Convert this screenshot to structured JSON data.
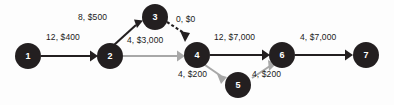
{
  "diagram": {
    "colors": {
      "node_fill": "#231f20",
      "node_text": "#ffffff",
      "edge_dark": "#231f20",
      "edge_gray": "#a8a8a8",
      "background": "#fdfdfd"
    },
    "nodes": [
      {
        "id": "1",
        "label": "1",
        "cx": 28,
        "cy": 56,
        "r": 13
      },
      {
        "id": "2",
        "label": "2",
        "cx": 110,
        "cy": 56,
        "r": 13
      },
      {
        "id": "3",
        "label": "3",
        "cx": 155,
        "cy": 17,
        "r": 13
      },
      {
        "id": "4",
        "label": "4",
        "cx": 197,
        "cy": 55,
        "r": 13
      },
      {
        "id": "5",
        "label": "5",
        "cx": 238,
        "cy": 85,
        "r": 13
      },
      {
        "id": "6",
        "label": "6",
        "cx": 282,
        "cy": 55,
        "r": 13
      },
      {
        "id": "7",
        "label": "7",
        "cx": 366,
        "cy": 55,
        "r": 13
      }
    ],
    "edges": [
      {
        "id": "e1",
        "from": "1",
        "to": "2",
        "label": "12, $400",
        "capacity": 12,
        "cost": "$400",
        "style": "dark"
      },
      {
        "id": "e2",
        "from": "2",
        "to": "3",
        "label": "8, $500",
        "capacity": 8,
        "cost": "$500",
        "style": "dark"
      },
      {
        "id": "e3",
        "from": "2",
        "to": "4",
        "label": "4, $3,000",
        "capacity": 4,
        "cost": "$3,000",
        "style": "gray"
      },
      {
        "id": "e4",
        "from": "3",
        "to": "4",
        "label": "0, $0",
        "capacity": 0,
        "cost": "$0",
        "style": "dashed"
      },
      {
        "id": "e5",
        "from": "4",
        "to": "6",
        "label": "12, $7,000",
        "capacity": 12,
        "cost": "$7,000",
        "style": "dark"
      },
      {
        "id": "e6",
        "from": "4",
        "to": "5",
        "label": "4, $200",
        "capacity": 4,
        "cost": "$200",
        "style": "gray"
      },
      {
        "id": "e7",
        "from": "5",
        "to": "6",
        "label": "4, $200",
        "capacity": 4,
        "cost": "$200",
        "style": "gray"
      },
      {
        "id": "e8",
        "from": "6",
        "to": "7",
        "label": "4, $7,000",
        "capacity": 4,
        "cost": "$7,000",
        "style": "dark"
      }
    ],
    "edge_labels": [
      {
        "for": "e1",
        "text": "12, $400",
        "x": 46,
        "y": 40
      },
      {
        "for": "e2",
        "text": "8, $500",
        "x": 78,
        "y": 20
      },
      {
        "for": "e3",
        "text": "4, $3,000",
        "x": 127,
        "y": 43
      },
      {
        "for": "e4",
        "text": "0, $0",
        "x": 176,
        "y": 22
      },
      {
        "for": "e5",
        "text": "12, $7,000",
        "x": 214,
        "y": 40
      },
      {
        "for": "e6",
        "text": "4, $200",
        "x": 178,
        "y": 74
      },
      {
        "for": "e7",
        "text": "4, $200",
        "x": 252,
        "y": 74
      },
      {
        "for": "e8",
        "text": "4, $7,000",
        "x": 300,
        "y": 40
      }
    ]
  }
}
